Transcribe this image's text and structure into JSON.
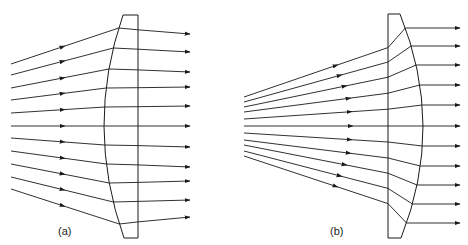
{
  "figure": {
    "panels": [
      {
        "id": "a",
        "label": "(a)",
        "description": "Converging rays refracted into parallel beam by plano-convex lens (curved side facing source)",
        "lens": {
          "top_y": 15,
          "bottom_y": 238,
          "flat_x": 138,
          "curve_top_x": 123,
          "curve_mid_x": 104,
          "curve_bottom_x": 124,
          "curve_side": "left"
        },
        "rays": {
          "start_x": 11,
          "start_y": [
            64,
            75,
            88,
            100,
            113,
            126,
            138,
            151,
            164,
            177,
            189
          ],
          "hit_y": [
            28,
            48,
            69,
            88,
            107,
            126,
            145,
            164,
            183,
            202,
            224
          ],
          "end_x": 190,
          "end_y": [
            34,
            52,
            72,
            87,
            106,
            126,
            147,
            167,
            181,
            200,
            217
          ],
          "arrow_x": 65
        }
      },
      {
        "id": "b",
        "label": "(b)",
        "description": "Diverging rays refracted into parallel beam by plano-convex lens (flat side facing source)",
        "lens": {
          "top_y": 14,
          "bottom_y": 238,
          "flat_x": 388,
          "curve_top_x": 400,
          "curve_mid_x": 423,
          "curve_bottom_x": 401,
          "curve_side": "right"
        },
        "rays": {
          "start_x": 244,
          "start_y": [
            97,
            102,
            107,
            112,
            119,
            126,
            133,
            140,
            145,
            151,
            156
          ],
          "end_x": 460,
          "end_y": [
            28,
            46,
            65,
            85,
            105,
            126,
            146,
            166,
            185,
            204,
            223
          ],
          "arrow_x": [
            338,
            342,
            347,
            351,
            352,
            353,
            352,
            351,
            347,
            342,
            338
          ]
        }
      }
    ],
    "colors": {
      "stroke": "#1a1a1a",
      "background": "#ffffff"
    }
  }
}
